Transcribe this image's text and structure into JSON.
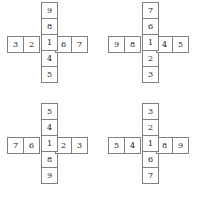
{
  "figure": {
    "type": "cross-shaped-number-grids",
    "count": 4,
    "colors": {
      "background": "#ffffff",
      "cell_fill": "#ffffff",
      "border": "#808080",
      "text": "#1a1a1a"
    },
    "grid_layout": {
      "rows": 2,
      "columns": 2
    },
    "crosses": [
      {
        "name": "cross-top-left",
        "position": "top-left",
        "horizontal": [
          "3",
          "2",
          "1",
          "6",
          "7"
        ],
        "vertical": [
          "9",
          "8",
          "1",
          "4",
          "5"
        ],
        "center": "1"
      },
      {
        "name": "cross-top-right",
        "position": "top-right",
        "horizontal": [
          "9",
          "8",
          "1",
          "4",
          "5"
        ],
        "vertical": [
          "7",
          "6",
          "1",
          "2",
          "3"
        ],
        "center": "1"
      },
      {
        "name": "cross-bottom-left",
        "position": "bottom-left",
        "horizontal": [
          "7",
          "6",
          "1",
          "2",
          "3"
        ],
        "vertical": [
          "5",
          "4",
          "1",
          "8",
          "9"
        ],
        "center": "1"
      },
      {
        "name": "cross-bottom-right",
        "position": "bottom-right",
        "horizontal": [
          "5",
          "4",
          "1",
          "8",
          "9"
        ],
        "vertical": [
          "3",
          "2",
          "1",
          "6",
          "7"
        ],
        "center": "1"
      }
    ]
  }
}
